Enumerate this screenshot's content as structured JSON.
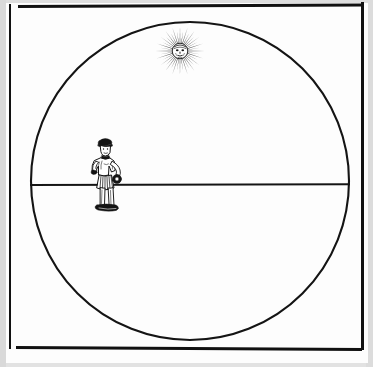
{
  "image": {
    "kind": "historical-woodcut-illustration",
    "caption": "",
    "background_color": "#e6e6e6",
    "paper_color": "#fdfdfd",
    "ink_color": "#141414"
  },
  "frame": {
    "name": "rectangular-border",
    "top_rule": "",
    "bottom_rule": "",
    "left_rule": "",
    "right_rule": ""
  },
  "scene": {
    "sphere": {
      "label": "celestial-sphere-circle",
      "center_x": 190,
      "center_y": 181,
      "radius": 160
    },
    "horizon": {
      "label": "horizon-line",
      "y": 185,
      "x_start": 30,
      "x_end": 350
    },
    "sun": {
      "label": "radiant-sun-with-face",
      "center_x": 180,
      "center_y": 51,
      "ray_count": 40,
      "face": "human-face"
    },
    "figure": {
      "label": "standing-man-holding-sphere",
      "center_x": 104,
      "base_y": 218,
      "holds": "round-object"
    }
  }
}
